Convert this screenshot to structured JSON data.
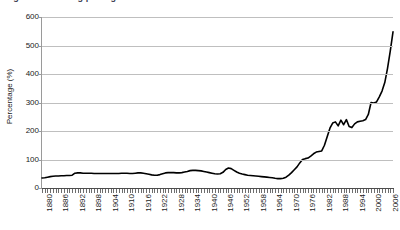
{
  "figure": {
    "title_cropped": "Figure 1: Housing price growth index",
    "background": "#ffffff",
    "line_color": "#000000",
    "gridline_color": "#bfbfbf",
    "axis_color": "#4d4d4d"
  },
  "chart_data": {
    "type": "line",
    "title": "Figure 1: Housing price growth index",
    "xlabel": "",
    "ylabel": "Percentage (%)",
    "ylim": [
      0,
      600
    ],
    "xlim": [
      1880,
      2008
    ],
    "grid": true,
    "legend": false,
    "ytick_labels": [
      "0",
      "100",
      "200",
      "300",
      "400",
      "500",
      "600"
    ],
    "ytick_values": [
      0,
      100,
      200,
      300,
      400,
      500,
      600
    ],
    "xtick_labels": [
      "1880",
      "1886",
      "1892",
      "1898",
      "1904",
      "1910",
      "1916",
      "1922",
      "1928",
      "1934",
      "1940",
      "1946",
      "1952",
      "1958",
      "1964",
      "1970",
      "1976",
      "1982",
      "1988",
      "1994",
      "2000",
      "2006"
    ],
    "xtick_values": [
      1880,
      1886,
      1892,
      1898,
      1904,
      1910,
      1916,
      1922,
      1928,
      1934,
      1940,
      1946,
      1952,
      1958,
      1964,
      1970,
      1976,
      1982,
      1988,
      1994,
      2000,
      2006
    ],
    "xtick_minor_step": 1,
    "series": [
      {
        "name": "Percentage",
        "x": [
          1880,
          1881,
          1882,
          1883,
          1884,
          1885,
          1886,
          1887,
          1888,
          1889,
          1890,
          1891,
          1892,
          1893,
          1894,
          1895,
          1896,
          1897,
          1898,
          1899,
          1900,
          1901,
          1902,
          1903,
          1904,
          1905,
          1906,
          1907,
          1908,
          1909,
          1910,
          1911,
          1912,
          1913,
          1914,
          1915,
          1916,
          1917,
          1918,
          1919,
          1920,
          1921,
          1922,
          1923,
          1924,
          1925,
          1926,
          1927,
          1928,
          1929,
          1930,
          1931,
          1932,
          1933,
          1934,
          1935,
          1936,
          1937,
          1938,
          1939,
          1940,
          1941,
          1942,
          1943,
          1944,
          1945,
          1946,
          1947,
          1948,
          1949,
          1950,
          1951,
          1952,
          1953,
          1954,
          1955,
          1956,
          1957,
          1958,
          1959,
          1960,
          1961,
          1962,
          1963,
          1964,
          1965,
          1966,
          1967,
          1968,
          1969,
          1970,
          1971,
          1972,
          1973,
          1974,
          1975,
          1976,
          1977,
          1978,
          1979,
          1980,
          1981,
          1982,
          1983,
          1984,
          1985,
          1986,
          1987,
          1988,
          1989,
          1990,
          1991,
          1992,
          1993,
          1994,
          1995,
          1996,
          1997,
          1998,
          1999,
          2000,
          2001,
          2002,
          2003,
          2004,
          2005,
          2006,
          2007,
          2008
        ],
        "y": [
          35,
          36,
          38,
          40,
          41,
          42,
          42,
          43,
          43,
          44,
          44,
          45,
          52,
          53,
          53,
          52,
          52,
          52,
          52,
          51,
          51,
          51,
          51,
          51,
          51,
          51,
          51,
          51,
          51,
          52,
          52,
          52,
          51,
          51,
          52,
          53,
          53,
          52,
          50,
          48,
          46,
          45,
          45,
          47,
          50,
          53,
          54,
          54,
          54,
          53,
          53,
          54,
          56,
          58,
          61,
          62,
          62,
          61,
          60,
          58,
          56,
          54,
          52,
          50,
          49,
          50,
          55,
          65,
          70,
          68,
          62,
          56,
          52,
          49,
          47,
          45,
          44,
          43,
          42,
          41,
          40,
          39,
          38,
          37,
          36,
          34,
          33,
          33,
          34,
          38,
          45,
          54,
          64,
          74,
          88,
          100,
          103,
          105,
          112,
          120,
          126,
          128,
          130,
          150,
          180,
          210,
          228,
          232,
          218,
          238,
          222,
          240,
          216,
          212,
          225,
          232,
          234,
          236,
          240,
          258,
          300,
          298,
          302,
          320,
          340,
          370,
          420,
          480,
          548
        ]
      }
    ]
  },
  "axes": {
    "y_title": "Percentage (%)"
  }
}
